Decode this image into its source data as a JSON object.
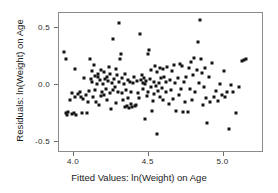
{
  "chart_data": {
    "type": "scatter",
    "title": "",
    "xlabel": "Fitted Values: ln(Weight) on Age",
    "ylabel": "Residuals: ln(Weight) on Age",
    "xlim": [
      3.9,
      5.27
    ],
    "ylim": [
      -0.6,
      0.63
    ],
    "xticks": [
      4.0,
      4.5,
      5.0
    ],
    "xticklabels": [
      "4.0",
      "4.5",
      "5.0"
    ],
    "yticks": [
      0.5,
      0.0,
      -0.5
    ],
    "yticklabels": [
      "0.5",
      "0.0",
      "-0.5"
    ],
    "grid": false,
    "legend": null,
    "marker": "square",
    "marker_color": "#141414",
    "marker_size": 3,
    "n_points": 175,
    "points": [
      [
        3.935,
        0.285
      ],
      [
        3.945,
        -0.25
      ],
      [
        3.95,
        0.225
      ],
      [
        3.955,
        -0.268
      ],
      [
        3.96,
        -0.24
      ],
      [
        3.975,
        -0.13
      ],
      [
        3.985,
        -0.075
      ],
      [
        3.99,
        -0.255
      ],
      [
        3.998,
        -0.245
      ],
      [
        4.005,
        -0.108
      ],
      [
        4.01,
        0.14
      ],
      [
        4.015,
        -0.262
      ],
      [
        4.03,
        -0.085
      ],
      [
        4.04,
        -0.062
      ],
      [
        4.048,
        -0.108
      ],
      [
        4.055,
        -0.245
      ],
      [
        4.062,
        -0.128
      ],
      [
        4.07,
        0.06
      ],
      [
        4.078,
        -0.09
      ],
      [
        4.085,
        -0.25
      ],
      [
        4.095,
        -0.155
      ],
      [
        4.1,
        -0.058
      ],
      [
        4.108,
        0.225
      ],
      [
        4.112,
        0.05
      ],
      [
        4.118,
        0.028
      ],
      [
        4.122,
        0.118
      ],
      [
        4.128,
        -0.112
      ],
      [
        4.132,
        0.175
      ],
      [
        4.138,
        0.075
      ],
      [
        4.142,
        -0.05
      ],
      [
        4.148,
        -0.148
      ],
      [
        4.152,
        0.005
      ],
      [
        4.158,
        0.065
      ],
      [
        4.162,
        0.098
      ],
      [
        4.168,
        -0.178
      ],
      [
        4.172,
        0.04
      ],
      [
        4.178,
        -0.1
      ],
      [
        4.182,
        0.125
      ],
      [
        4.188,
        -0.062
      ],
      [
        4.192,
        0.008
      ],
      [
        4.198,
        -0.092
      ],
      [
        4.202,
        0.11
      ],
      [
        4.208,
        0.052
      ],
      [
        4.212,
        -0.04
      ],
      [
        4.218,
        0.07
      ],
      [
        4.222,
        -0.135
      ],
      [
        4.228,
        0.03
      ],
      [
        4.232,
        0.158
      ],
      [
        4.238,
        -0.07
      ],
      [
        4.242,
        0.095
      ],
      [
        4.248,
        -0.21
      ],
      [
        4.252,
        0.012
      ],
      [
        4.258,
        -0.05
      ],
      [
        4.262,
        0.405
      ],
      [
        4.268,
        0.048
      ],
      [
        4.272,
        -0.018
      ],
      [
        4.278,
        0.135
      ],
      [
        4.282,
        -0.158
      ],
      [
        4.288,
        0.085
      ],
      [
        4.292,
        -0.06
      ],
      [
        4.298,
        0.02
      ],
      [
        4.302,
        0.54
      ],
      [
        4.308,
        0.23
      ],
      [
        4.312,
        0.268
      ],
      [
        4.318,
        -0.072
      ],
      [
        4.322,
        0.058
      ],
      [
        4.328,
        -0.132
      ],
      [
        4.332,
        0.005
      ],
      [
        4.338,
        -0.195
      ],
      [
        4.342,
        0.09
      ],
      [
        4.348,
        -0.05
      ],
      [
        4.352,
        -0.188
      ],
      [
        4.358,
        0.042
      ],
      [
        4.362,
        -0.115
      ],
      [
        4.368,
        -0.205
      ],
      [
        4.372,
        0.022
      ],
      [
        4.378,
        -0.062
      ],
      [
        4.382,
        -0.17
      ],
      [
        4.388,
        -0.2
      ],
      [
        4.392,
        0.015
      ],
      [
        4.398,
        0.068
      ],
      [
        4.405,
        -0.19
      ],
      [
        4.412,
        -0.182
      ],
      [
        4.418,
        0.03
      ],
      [
        4.425,
        -0.07
      ],
      [
        4.432,
        -0.118
      ],
      [
        4.44,
        0.448
      ],
      [
        4.448,
        0.045
      ],
      [
        4.452,
        0.088
      ],
      [
        4.458,
        0.018
      ],
      [
        4.462,
        -0.035
      ],
      [
        4.468,
        0.062
      ],
      [
        4.472,
        0.008
      ],
      [
        4.478,
        -0.298
      ],
      [
        4.482,
        0.03
      ],
      [
        4.488,
        -0.098
      ],
      [
        4.492,
        0.268
      ],
      [
        4.498,
        -0.06
      ],
      [
        4.502,
        0.305
      ],
      [
        4.508,
        0.052
      ],
      [
        4.512,
        -0.02
      ],
      [
        4.518,
        0.13
      ],
      [
        4.522,
        -0.232
      ],
      [
        4.528,
        -0.145
      ],
      [
        4.532,
        0.028
      ],
      [
        4.538,
        -0.078
      ],
      [
        4.542,
        0.162
      ],
      [
        4.548,
        -0.012
      ],
      [
        4.552,
        -0.435
      ],
      [
        4.558,
        0.108
      ],
      [
        4.562,
        -0.058
      ],
      [
        4.568,
        0.018
      ],
      [
        4.572,
        0.15
      ],
      [
        4.578,
        -0.105
      ],
      [
        4.582,
        0.06
      ],
      [
        4.588,
        -0.03
      ],
      [
        4.592,
        0.142
      ],
      [
        4.598,
        -0.135
      ],
      [
        4.605,
        0.072
      ],
      [
        4.612,
        -0.062
      ],
      [
        4.618,
        0.025
      ],
      [
        4.625,
        0.158
      ],
      [
        4.632,
        -0.172
      ],
      [
        4.64,
        0.04
      ],
      [
        4.648,
        -0.048
      ],
      [
        4.655,
        0.118
      ],
      [
        4.662,
        -0.122
      ],
      [
        4.67,
        0.17
      ],
      [
        4.678,
        0.015
      ],
      [
        4.685,
        -0.235
      ],
      [
        4.692,
        0.058
      ],
      [
        4.7,
        -0.09
      ],
      [
        4.708,
        0.185
      ],
      [
        4.715,
        -0.035
      ],
      [
        4.722,
        0.165
      ],
      [
        4.73,
        -0.24
      ],
      [
        4.738,
        0.028
      ],
      [
        4.745,
        -0.148
      ],
      [
        4.752,
        0.072
      ],
      [
        4.76,
        -0.238
      ],
      [
        4.768,
        0.15
      ],
      [
        4.775,
        -0.042
      ],
      [
        4.782,
        0.198
      ],
      [
        4.79,
        -0.13
      ],
      [
        4.798,
        0.088
      ],
      [
        4.805,
        0.238
      ],
      [
        4.812,
        -0.068
      ],
      [
        4.82,
        0.128
      ],
      [
        4.828,
        0.375
      ],
      [
        4.835,
        0.018
      ],
      [
        4.842,
        0.565
      ],
      [
        4.848,
        0.225
      ],
      [
        4.855,
        0.102
      ],
      [
        4.862,
        -0.178
      ],
      [
        4.87,
        -0.022
      ],
      [
        4.878,
        0.148
      ],
      [
        4.885,
        -0.118
      ],
      [
        4.892,
        -0.335
      ],
      [
        4.9,
        0.068
      ],
      [
        4.912,
        -0.152
      ],
      [
        4.925,
        0.195
      ],
      [
        4.938,
        -0.108
      ],
      [
        4.95,
        -0.058
      ],
      [
        4.962,
        -0.142
      ],
      [
        4.975,
        0.01
      ],
      [
        4.988,
        -0.09
      ],
      [
        5.0,
        0.118
      ],
      [
        5.012,
        -0.105
      ],
      [
        5.025,
        -0.068
      ],
      [
        5.038,
        -0.39
      ],
      [
        5.05,
        0.0
      ],
      [
        5.062,
        -0.06
      ],
      [
        5.08,
        -0.248
      ],
      [
        5.1,
        -0.022
      ],
      [
        5.12,
        0.205
      ],
      [
        5.135,
        0.218
      ],
      [
        5.148,
        0.222
      ]
    ]
  }
}
